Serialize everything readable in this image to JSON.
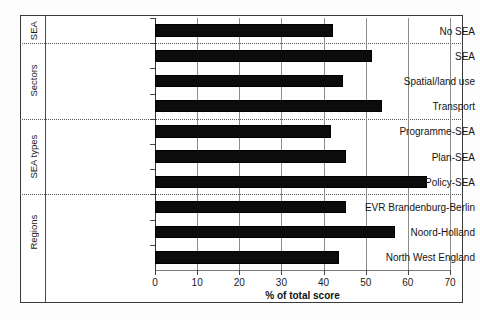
{
  "chart_data": {
    "type": "bar",
    "orientation": "horizontal",
    "title": "",
    "xlabel": "% of total score",
    "ylabel": "",
    "xlim": [
      0,
      70
    ],
    "xticks": [
      0,
      10,
      20,
      30,
      40,
      50,
      60,
      70
    ],
    "grid": true,
    "legend": null,
    "bar_color": "#0c0c0c",
    "categories": [
      "No SEA",
      "SEA",
      "Spatial/land use",
      "Transport",
      "Programme-SEA",
      "Plan-SEA",
      "Policy-SEA",
      "EVR Brandenburg-Berlin",
      "Noord-Holland",
      "North West England"
    ],
    "values": [
      42.3,
      51.5,
      44.7,
      53.9,
      41.8,
      45.4,
      64.6,
      45.3,
      57.0,
      43.7
    ],
    "groups": [
      {
        "label": "SEA",
        "categories": [
          "No SEA"
        ]
      },
      {
        "label": "Sectors",
        "categories": [
          "SEA",
          "Spatial/land use",
          "Transport"
        ]
      },
      {
        "label": "SEA types",
        "categories": [
          "Programme-SEA",
          "Plan-SEA",
          "Policy-SEA"
        ]
      },
      {
        "label": "Regions",
        "categories": [
          "EVR Brandenburg-Berlin",
          "Noord-Holland",
          "North West England"
        ]
      }
    ]
  }
}
